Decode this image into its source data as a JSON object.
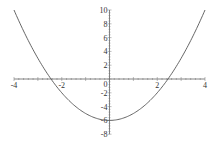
{
  "chart_data": {
    "type": "line",
    "title": "",
    "xlabel": "",
    "ylabel": "",
    "function": "y = x^2 - 6",
    "xlim": [
      -4,
      4
    ],
    "ylim": [
      -8,
      10
    ],
    "grid": false,
    "legend": null,
    "x_ticks": [
      "-4",
      "-2",
      "2",
      "4"
    ],
    "y_ticks": [
      "10",
      "8",
      "6",
      "4",
      "2",
      "0",
      "-2",
      "-4",
      "-6",
      "-8"
    ],
    "series": [
      {
        "name": "curve",
        "color": "#555555",
        "x": [
          -4,
          -3.5,
          -3,
          -2.5,
          -2,
          -1.5,
          -1,
          -0.5,
          0,
          0.5,
          1,
          1.5,
          2,
          2.5,
          3,
          3.5,
          4
        ],
        "y": [
          10,
          6.25,
          3,
          0.25,
          -2,
          -3.75,
          -5,
          -5.75,
          -6,
          -5.75,
          -5,
          -3.75,
          -2,
          0.25,
          3,
          6.25,
          10
        ]
      }
    ]
  },
  "layout": {
    "x_pixel_min": 14,
    "x_pixel_max": 205,
    "y_pixel_zero": 79,
    "px_per_unit_y": 6.9
  }
}
